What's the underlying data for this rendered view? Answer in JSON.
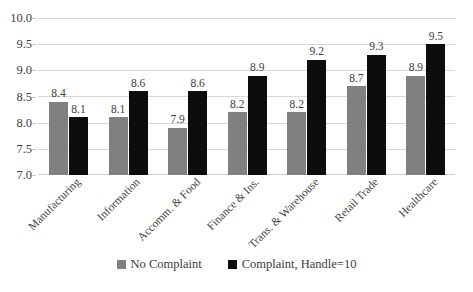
{
  "chart_data": {
    "type": "bar",
    "title": "",
    "subtitle": "",
    "xlabel": "",
    "ylabel": "",
    "ylim": [
      7.0,
      10.0
    ],
    "ytick_labels": [
      "10.0",
      "9.5",
      "9.0",
      "8.5",
      "8.0",
      "7.5",
      "7.0"
    ],
    "ytick_values": [
      10.0,
      9.5,
      9.0,
      8.5,
      8.0,
      7.5,
      7.0
    ],
    "grid": true,
    "legend_position": "bottom",
    "categories": [
      "Manufacturing",
      "Information",
      "Accomm. & Food",
      "Finance & Ins.",
      "Trans. & Warehouse",
      "Retail Trade",
      "Healthcare"
    ],
    "series": [
      {
        "name": "No Complaint",
        "color": "#808080",
        "values": [
          8.4,
          8.1,
          7.9,
          8.2,
          8.2,
          8.7,
          8.9
        ],
        "labels": [
          "8.4",
          "8.1",
          "7.9",
          "8.2",
          "8.2",
          "8.7",
          "8.9"
        ]
      },
      {
        "name": "Complaint, Handle=10",
        "color": "#0d0d0d",
        "values": [
          8.1,
          8.6,
          8.6,
          8.9,
          9.2,
          9.3,
          9.5
        ],
        "labels": [
          "8.1",
          "8.6",
          "8.6",
          "8.9",
          "9.2",
          "9.3",
          "9.5"
        ]
      }
    ]
  },
  "legend": {
    "entries": [
      {
        "label": "No Complaint",
        "color": "#808080"
      },
      {
        "label": "Complaint, Handle=10",
        "color": "#0d0d0d"
      }
    ]
  }
}
